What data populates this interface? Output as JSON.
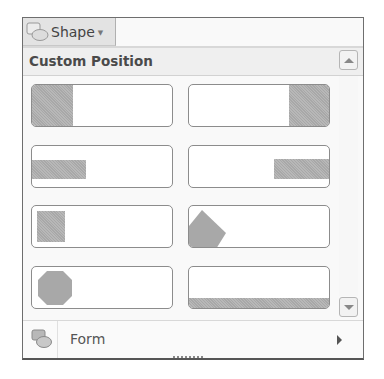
{
  "shape_button": {
    "label": "Shape",
    "icon": "shapes-icon",
    "dropdown_icon": "caret-down-icon"
  },
  "gallery": {
    "section_title": "Custom Position",
    "items": [
      {
        "name": "left-block",
        "description": "Left block"
      },
      {
        "name": "right-block",
        "description": "Right block"
      },
      {
        "name": "left-bar",
        "description": "Left bar"
      },
      {
        "name": "right-bar",
        "description": "Right bar"
      },
      {
        "name": "left-square",
        "description": "Left square"
      },
      {
        "name": "left-diamond",
        "description": "Left diamond"
      },
      {
        "name": "left-circle",
        "description": "Left circle"
      },
      {
        "name": "bottom-band",
        "description": "Bottom band"
      }
    ],
    "scroll_up_icon": "triangle-up-icon",
    "scroll_down_icon": "triangle-down-icon"
  },
  "form_item": {
    "label": "Form",
    "icon": "form-shapes-icon",
    "submenu_icon": "chevron-right-icon"
  },
  "colors": {
    "fill": "#a8a8a8",
    "border": "#8c8c8c",
    "panel_bg": "#f9f9f9"
  }
}
